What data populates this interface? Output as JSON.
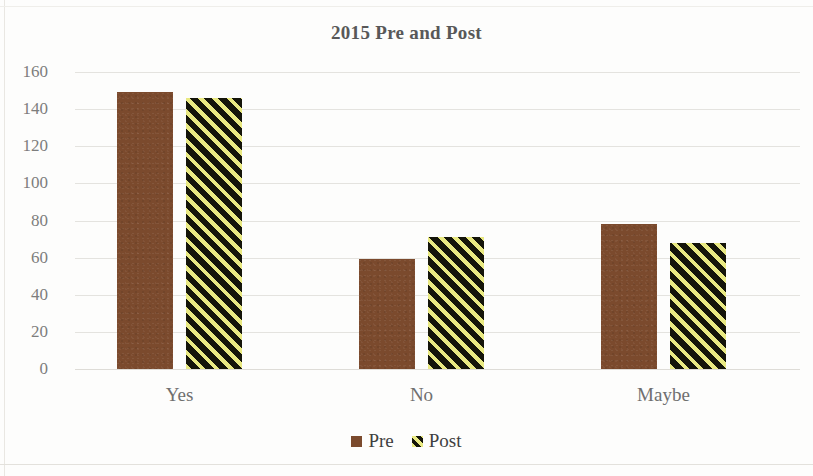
{
  "chart_data": {
    "type": "bar",
    "title": "2015 Pre and Post",
    "xlabel": "",
    "ylabel": "",
    "categories": [
      "Yes",
      "No",
      "Maybe"
    ],
    "series": [
      {
        "name": "Pre",
        "values": [
          149,
          59,
          78
        ],
        "color": "#7B4A2D",
        "fill": "solid-brown"
      },
      {
        "name": "Post",
        "values": [
          146,
          71,
          68
        ],
        "color": "#E9E982",
        "fill": "yellow-black-diagonal-stripes"
      }
    ],
    "ylim": [
      0,
      160
    ],
    "ytick_step": 20,
    "yticks": [
      "0",
      "20",
      "40",
      "60",
      "80",
      "100",
      "120",
      "140",
      "160"
    ],
    "grid": true,
    "grid_axis": "y",
    "legend_position": "bottom",
    "legend_entries": [
      "Pre",
      "Post"
    ]
  },
  "colors": {
    "brown": "#7B4A2D",
    "stripe_yellow": "#E9E982",
    "stripe_dark": "#15150A",
    "gridline": "#E4E3DF",
    "title_text": "#585858",
    "tick_text": "#7D7D7D",
    "background": "#FDFDFC"
  }
}
